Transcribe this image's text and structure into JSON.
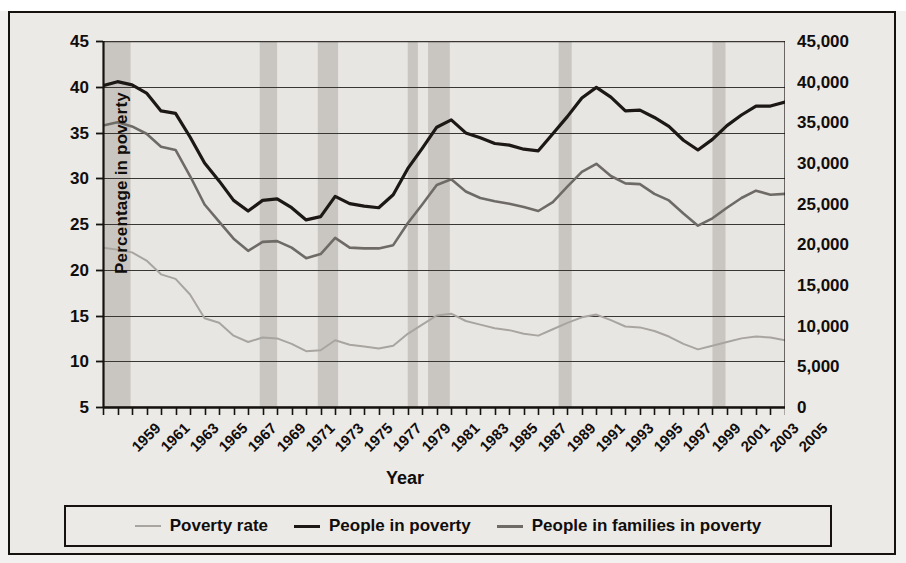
{
  "figure": {
    "background_color": "#eceae7",
    "plot_background_color": "#e8e6e3",
    "frame_color": "#16120f",
    "recession_band_color": "#c9c6c1"
  },
  "axes": {
    "left": {
      "title": "Percentage in poverty",
      "ticks": [
        "45",
        "40",
        "35",
        "30",
        "25",
        "20",
        "15",
        "10",
        "5"
      ],
      "min": 5,
      "max": 45,
      "step": 5
    },
    "right": {
      "title": "Millions in poverty",
      "ticks": [
        "45,000",
        "40,000",
        "35,000",
        "30,000",
        "25,000",
        "20,000",
        "15,000",
        "10,000",
        "5,000",
        "0"
      ],
      "min": 0,
      "max": 45000,
      "step": 5000
    },
    "x": {
      "title": "Year",
      "ticks": [
        "1959",
        "1961",
        "1963",
        "1965",
        "1967",
        "1969",
        "1971",
        "1973",
        "1975",
        "1977",
        "1979",
        "1981",
        "1983",
        "1985",
        "1987",
        "1989",
        "1991",
        "1993",
        "1995",
        "1997",
        "1999",
        "2001",
        "2003",
        "2005"
      ],
      "min": 1959,
      "max": 2006
    }
  },
  "legend": {
    "items": [
      {
        "label": "Poverty rate",
        "color": "#a8a5a0",
        "width": 2
      },
      {
        "label": "People in poverty",
        "color": "#1b1815",
        "width": 3.2
      },
      {
        "label": "People in families in poverty",
        "color": "#6e6b67",
        "width": 2.6
      }
    ]
  },
  "chart_data": {
    "type": "line",
    "title": "",
    "xlabel": "Year",
    "ylabel": "Percentage in poverty",
    "ylabel_secondary": "Millions in poverty",
    "xlim": [
      1959,
      2006
    ],
    "ylim": [
      5,
      45
    ],
    "ylim_secondary": [
      0,
      45000
    ],
    "grid": true,
    "legend_position": "bottom",
    "x": [
      1959,
      1960,
      1961,
      1962,
      1963,
      1964,
      1965,
      1966,
      1967,
      1968,
      1969,
      1970,
      1971,
      1972,
      1973,
      1974,
      1975,
      1976,
      1977,
      1978,
      1979,
      1980,
      1981,
      1982,
      1983,
      1984,
      1985,
      1986,
      1987,
      1988,
      1989,
      1990,
      1991,
      1992,
      1993,
      1994,
      1995,
      1996,
      1997,
      1998,
      1999,
      2000,
      2001,
      2002,
      2003,
      2004,
      2005,
      2006
    ],
    "series": [
      {
        "name": "People in poverty",
        "axis": "right",
        "unit": "thousands",
        "color": "#1b1815",
        "values": [
          39500,
          40000,
          39600,
          38600,
          36400,
          36100,
          33200,
          30000,
          27800,
          25400,
          24100,
          25400,
          25600,
          24500,
          23000,
          23400,
          25900,
          25000,
          24700,
          24500,
          26100,
          29300,
          31800,
          34400,
          35300,
          33700,
          33100,
          32400,
          32200,
          31700,
          31500,
          33600,
          35700,
          38000,
          39300,
          38100,
          36400,
          36500,
          35600,
          34500,
          32800,
          31600,
          32900,
          34600,
          35900,
          37000,
          37000,
          37500
        ]
      },
      {
        "name": "People in families in poverty",
        "axis": "right",
        "unit": "thousands",
        "color": "#6e6b67",
        "values": [
          34600,
          35000,
          34500,
          33600,
          32000,
          31600,
          28400,
          24900,
          22800,
          20700,
          19200,
          20300,
          20400,
          19600,
          18300,
          18800,
          20800,
          19600,
          19500,
          19500,
          19900,
          22600,
          24900,
          27300,
          28000,
          26500,
          25700,
          25300,
          25000,
          24600,
          24100,
          25200,
          27100,
          28900,
          29900,
          28400,
          27500,
          27400,
          26200,
          25400,
          23800,
          22300,
          23200,
          24500,
          25700,
          26600,
          26100,
          26200
        ]
      },
      {
        "name": "Poverty rate",
        "axis": "left",
        "unit": "percent",
        "color": "#a8a5a0",
        "values": [
          22.4,
          22.2,
          21.9,
          21.0,
          19.5,
          19.0,
          17.3,
          14.7,
          14.2,
          12.8,
          12.1,
          12.6,
          12.5,
          11.9,
          11.1,
          11.2,
          12.3,
          11.8,
          11.6,
          11.4,
          11.7,
          13.0,
          14.0,
          15.0,
          15.2,
          14.4,
          14.0,
          13.6,
          13.4,
          13.0,
          12.8,
          13.5,
          14.2,
          14.8,
          15.1,
          14.5,
          13.8,
          13.7,
          13.3,
          12.7,
          11.9,
          11.3,
          11.7,
          12.1,
          12.5,
          12.7,
          12.6,
          12.3
        ]
      }
    ],
    "recession_bands": [
      {
        "start": 1959.0,
        "end": 1960.9
      },
      {
        "start": 1969.8,
        "end": 1971.0
      },
      {
        "start": 1973.8,
        "end": 1975.2
      },
      {
        "start": 1980.0,
        "end": 1980.7
      },
      {
        "start": 1981.4,
        "end": 1982.9
      },
      {
        "start": 1990.4,
        "end": 1991.3
      },
      {
        "start": 2001.0,
        "end": 2001.9
      }
    ]
  }
}
